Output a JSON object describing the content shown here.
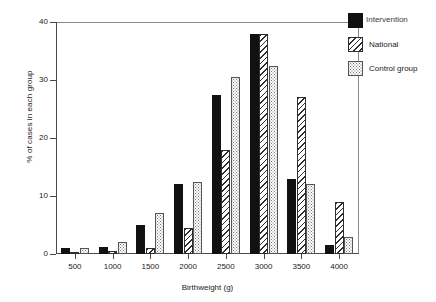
{
  "chart_data": {
    "type": "bar",
    "title": "",
    "xlabel": "Birthweight (g)",
    "ylabel": "% of cases in each group",
    "categories": [
      "500",
      "1000",
      "1500",
      "2000",
      "2500",
      "3000",
      "3500",
      "4000"
    ],
    "ylim": [
      0,
      40
    ],
    "yticks": [
      "0",
      "10",
      "20",
      "30",
      "40"
    ],
    "grid": false,
    "legend_position": "top-right",
    "series": [
      {
        "name": "Intervention",
        "pattern": "solid-black",
        "values": [
          1.0,
          1.2,
          5.0,
          12.0,
          27.5,
          38.0,
          13.0,
          1.5
        ]
      },
      {
        "name": "National",
        "pattern": "diagonal-hatch",
        "values": [
          0.3,
          0.5,
          1.0,
          4.5,
          18.0,
          38.0,
          27.0,
          9.0
        ]
      },
      {
        "name": "Control group",
        "pattern": "stipple-dots",
        "values": [
          1.0,
          2.0,
          7.0,
          12.5,
          30.5,
          32.5,
          12.0,
          3.0
        ]
      }
    ]
  },
  "legend": {
    "items": [
      {
        "label": "Intervention"
      },
      {
        "label": "National"
      },
      {
        "label": "Control group"
      }
    ]
  }
}
